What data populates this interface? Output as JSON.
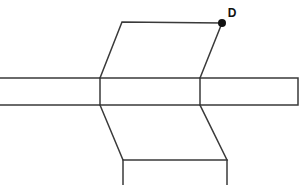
{
  "diagram": {
    "type": "line-drawing",
    "canvas": {
      "width": 306,
      "height": 185,
      "background": "#ffffff"
    },
    "style": {
      "stroke_color": "#3a3a3a",
      "stroke_width": 1.5,
      "dot_color": "#111111",
      "label_color": "#111111",
      "label_font_size": 12
    },
    "labels": [
      {
        "name": "D",
        "text": "D",
        "x": 232,
        "y": 14
      }
    ],
    "vertices": [
      {
        "name": "D",
        "x": 222,
        "y": 23,
        "marked": true,
        "dot_radius": 4
      }
    ],
    "shapes": [
      {
        "name": "horizontal-bar",
        "kind": "polyline",
        "closed": false,
        "points": "0,78 298,78 298,105 0,105"
      },
      {
        "name": "top-parallelogram",
        "kind": "polyline",
        "closed": false,
        "points": "100,78 122,22 222,23 200,78"
      },
      {
        "name": "bottom-parallelogram",
        "kind": "polyline",
        "closed": false,
        "points": "100,105 123,160 227,160 200,105"
      },
      {
        "name": "bottom-box-left-edge",
        "kind": "polyline",
        "closed": false,
        "points": "123,160 123,185"
      },
      {
        "name": "bottom-box-right-edge",
        "kind": "polyline",
        "closed": false,
        "points": "227,160 227,185"
      },
      {
        "name": "bar-left-divider",
        "kind": "polyline",
        "closed": false,
        "points": "100,78 100,105"
      },
      {
        "name": "bar-right-divider",
        "kind": "polyline",
        "closed": false,
        "points": "200,78 200,105"
      }
    ]
  }
}
